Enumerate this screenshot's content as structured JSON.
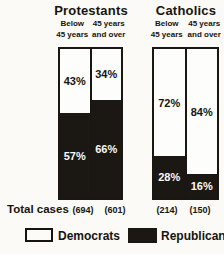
{
  "chart_data": {
    "type": "bar",
    "subtype": "100%-stacked-columns",
    "unit": "percent",
    "ylim": [
      0,
      100
    ],
    "grid": false,
    "legend_position": "bottom",
    "groups": [
      {
        "title": "Protestants",
        "columns": [
          {
            "label_line1": "Below",
            "label_line2": "45 years",
            "segments": {
              "democrats": 43,
              "republicans": 57
            },
            "democrats_label": "43%",
            "republicans_label": "57%",
            "total_cases": "(694)"
          },
          {
            "label_line1": "45 years",
            "label_line2": "and over",
            "segments": {
              "democrats": 34,
              "republicans": 66
            },
            "democrats_label": "34%",
            "republicans_label": "66%",
            "total_cases": "(601)"
          }
        ]
      },
      {
        "title": "Catholics",
        "columns": [
          {
            "label_line1": "Below",
            "label_line2": "45 years",
            "segments": {
              "democrats": 72,
              "republicans": 28
            },
            "democrats_label": "72%",
            "republicans_label": "28%",
            "total_cases": "(214)"
          },
          {
            "label_line1": "45 years",
            "label_line2": "and over",
            "segments": {
              "democrats": 84,
              "republicans": 16
            },
            "democrats_label": "84%",
            "republicans_label": "16%",
            "total_cases": "(150)"
          }
        ]
      }
    ],
    "footer": {
      "total_cases_label": "Total cases"
    },
    "legend": [
      {
        "label": "Democrats",
        "color": "#ffffff"
      },
      {
        "label": "Republicans",
        "color": "#1b1814"
      }
    ],
    "colors": {
      "ink": "#17140f",
      "paper": "#fbfaf6",
      "democrat_fill": "#fdfdfb",
      "republican_fill": "#1b1814"
    }
  }
}
